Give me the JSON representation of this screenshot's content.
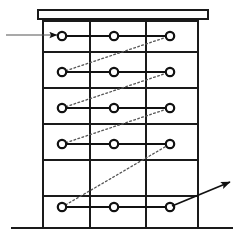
{
  "figure": {
    "title": "",
    "type": "schematic-diagram",
    "background_color": "#ffffff",
    "stroke_color": "#1a1a1a",
    "dotted_stroke_color": "#555555",
    "width": 243,
    "height": 244
  },
  "geometry": {
    "cap_bar": {
      "label": "top-cap-bar",
      "x": 38,
      "y": 10,
      "width": 170,
      "height": 9
    },
    "ground_line": {
      "label": "ground-line",
      "x1": 12,
      "x2": 232,
      "y": 228
    },
    "verticals": {
      "label": "vertical-columns",
      "x_positions": [
        43,
        90,
        146,
        198
      ],
      "y_top": 19,
      "y_bottom": 228
    },
    "row_dividers": {
      "label": "horizontal-shelf-lines",
      "x1": 43,
      "x2": 198,
      "y_positions": [
        21,
        52,
        88,
        124,
        160,
        196
      ]
    },
    "node_radius": 4.2,
    "node_columns_x": [
      62,
      114,
      170
    ],
    "rows": [
      {
        "id": "row-1",
        "y": 36
      },
      {
        "id": "row-2",
        "y": 72
      },
      {
        "id": "row-3",
        "y": 108
      },
      {
        "id": "row-4",
        "y": 144
      },
      {
        "id": "row-5",
        "y": 207
      }
    ]
  },
  "nodes": [
    {
      "id": "n-1-1",
      "name": "node-row1-col1",
      "x": 62,
      "y": 36
    },
    {
      "id": "n-1-2",
      "name": "node-row1-col2",
      "x": 114,
      "y": 36
    },
    {
      "id": "n-1-3",
      "name": "node-row1-col3",
      "x": 170,
      "y": 36
    },
    {
      "id": "n-2-1",
      "name": "node-row2-col1",
      "x": 62,
      "y": 72
    },
    {
      "id": "n-2-2",
      "name": "node-row2-col2",
      "x": 114,
      "y": 72
    },
    {
      "id": "n-2-3",
      "name": "node-row2-col3",
      "x": 170,
      "y": 72
    },
    {
      "id": "n-3-1",
      "name": "node-row3-col1",
      "x": 62,
      "y": 108
    },
    {
      "id": "n-3-2",
      "name": "node-row3-col2",
      "x": 114,
      "y": 108
    },
    {
      "id": "n-3-3",
      "name": "node-row3-col3",
      "x": 170,
      "y": 108
    },
    {
      "id": "n-4-1",
      "name": "node-row4-col1",
      "x": 62,
      "y": 144
    },
    {
      "id": "n-4-2",
      "name": "node-row4-col2",
      "x": 114,
      "y": 144
    },
    {
      "id": "n-4-3",
      "name": "node-row4-col3",
      "x": 170,
      "y": 144
    },
    {
      "id": "n-5-1",
      "name": "node-row5-col1",
      "x": 62,
      "y": 207
    },
    {
      "id": "n-5-2",
      "name": "node-row5-col2",
      "x": 114,
      "y": 207
    },
    {
      "id": "n-5-3",
      "name": "node-row5-col3",
      "x": 170,
      "y": 207
    }
  ],
  "solid_connectors": [
    {
      "name": "connector-row1-a",
      "x1": 62,
      "y1": 36,
      "x2": 114,
      "y2": 36
    },
    {
      "name": "connector-row1-b",
      "x1": 114,
      "y1": 36,
      "x2": 170,
      "y2": 36
    },
    {
      "name": "connector-row2-a",
      "x1": 62,
      "y1": 72,
      "x2": 114,
      "y2": 72
    },
    {
      "name": "connector-row2-b",
      "x1": 114,
      "y1": 72,
      "x2": 170,
      "y2": 72
    },
    {
      "name": "connector-row3-a",
      "x1": 62,
      "y1": 108,
      "x2": 114,
      "y2": 108
    },
    {
      "name": "connector-row3-b",
      "x1": 114,
      "y1": 108,
      "x2": 170,
      "y2": 108
    },
    {
      "name": "connector-row4-a",
      "x1": 62,
      "y1": 144,
      "x2": 114,
      "y2": 144
    },
    {
      "name": "connector-row4-b",
      "x1": 114,
      "y1": 144,
      "x2": 170,
      "y2": 144
    },
    {
      "name": "connector-row5-a",
      "x1": 62,
      "y1": 207,
      "x2": 114,
      "y2": 207
    },
    {
      "name": "connector-row5-b",
      "x1": 114,
      "y1": 207,
      "x2": 170,
      "y2": 207
    }
  ],
  "dotted_connectors": [
    {
      "name": "dotted-link-row2-to-row1",
      "x1": 62,
      "y1": 72,
      "x2": 170,
      "y2": 36
    },
    {
      "name": "dotted-link-row3-to-row2",
      "x1": 62,
      "y1": 108,
      "x2": 170,
      "y2": 72
    },
    {
      "name": "dotted-link-row4-to-row3",
      "x1": 62,
      "y1": 144,
      "x2": 170,
      "y2": 108
    },
    {
      "name": "dotted-link-row5-to-row4",
      "x1": 62,
      "y1": 207,
      "x2": 170,
      "y2": 144
    }
  ],
  "inlet_arrow": {
    "name": "inlet-arrow",
    "x1": 6,
    "y1": 35,
    "x2": 57,
    "y2": 35,
    "direction": "right"
  },
  "outlet_arrow": {
    "name": "outlet-arrow",
    "x1": 172,
    "y1": 206,
    "x2": 230,
    "y2": 182,
    "direction": "up-right"
  }
}
